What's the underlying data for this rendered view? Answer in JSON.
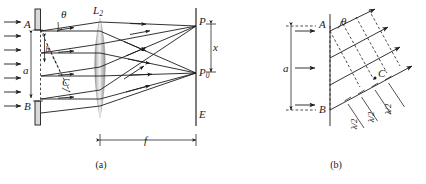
{
  "figure": {
    "panels": [
      {
        "id": "a",
        "caption": "(a)",
        "labels": {
          "slit_top": "A",
          "slit_bottom": "B",
          "slit_width_inner": "b",
          "aperture": "a",
          "lens": "L",
          "lens_subscript": "2",
          "angle": "θ",
          "point_C": "C",
          "screen_point_top": "P",
          "screen_point_center": "P",
          "screen_point_center_subscript": "0",
          "screen": "E",
          "offset": "x",
          "focal_length": "f"
        },
        "incoming_ray_count": 7,
        "lens_rays_out": 5
      },
      {
        "id": "b",
        "caption": "(b)",
        "labels": {
          "slit_top": "A",
          "slit_bottom": "B",
          "aperture": "a",
          "angle": "θ",
          "point_C": "C",
          "half_wave": "λ/2"
        },
        "incoming_ray_count": 3,
        "outgoing_ray_count": 4,
        "half_wave_marker_count": 3
      }
    ],
    "colors": {
      "ink": "#1c1c1c",
      "plate_fill": "#d9d9d9",
      "lens_fill": "#bdbdbd",
      "background": "#ffffff"
    }
  }
}
